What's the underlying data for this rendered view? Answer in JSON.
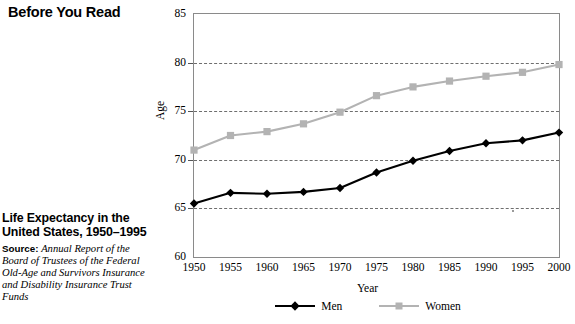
{
  "sidebar": {
    "kicker": "Before You Read",
    "figure_title": "Life Expectancy in the United States, 1950–1995",
    "source_label": "Source:",
    "source_text": "Annual Report of the Board of Trustees of the Federal Old-Age and Survivors Insurance and Disability Insurance Trust Funds"
  },
  "legend": {
    "men_label": "Men",
    "women_label": "Women",
    "men_icon": "black-diamond-marker-icon",
    "women_icon": "gray-square-marker-icon"
  },
  "colors": {
    "men": "#000000",
    "women": "#b3b3b3",
    "grid": "#555555",
    "frame": "#8a8a8a",
    "background": "#ffffff"
  },
  "chart_data": {
    "type": "line",
    "title": "",
    "xlabel": "Year",
    "ylabel": "Age",
    "xlim": [
      1950,
      2000
    ],
    "ylim": [
      60,
      85
    ],
    "yticks": [
      60,
      65,
      70,
      75,
      80,
      85
    ],
    "xticks": [
      1950,
      1955,
      1960,
      1965,
      1970,
      1975,
      1980,
      1985,
      1990,
      1995,
      2000
    ],
    "grid": true,
    "grid_lines_at": [
      65,
      70,
      75,
      80
    ],
    "legend_position": "bottom-center",
    "x": [
      1950,
      1955,
      1960,
      1965,
      1970,
      1975,
      1980,
      1985,
      1990,
      1995,
      2000
    ],
    "series": [
      {
        "name": "Men",
        "marker": "diamond",
        "color": "#000000",
        "values": [
          65.5,
          66.6,
          66.5,
          66.7,
          67.1,
          68.7,
          69.9,
          70.9,
          71.7,
          72.0,
          72.8
        ]
      },
      {
        "name": "Women",
        "marker": "square",
        "color": "#b3b3b3",
        "values": [
          71.0,
          72.5,
          72.9,
          73.7,
          74.9,
          76.6,
          77.5,
          78.1,
          78.6,
          79.0,
          79.8
        ]
      }
    ]
  }
}
